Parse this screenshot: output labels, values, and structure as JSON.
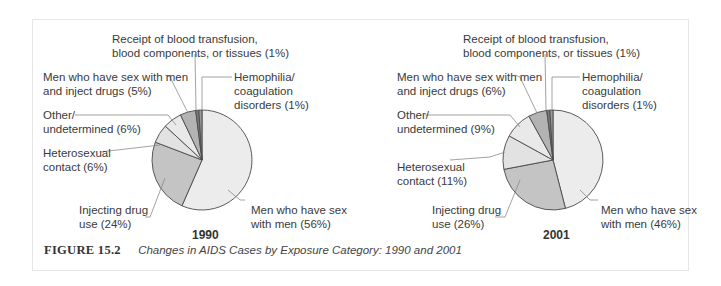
{
  "figure": {
    "number": "FIGURE 15.2",
    "title": "Changes in AIDS Cases by Exposure Category: 1990 and 2001"
  },
  "chart_data": [
    {
      "type": "pie",
      "title": "1990",
      "start_angle": "12 o'clock, clockwise",
      "categories": [
        "Men who have sex with men",
        "Injecting drug use",
        "Heterosexual contact",
        "Other/ undetermined",
        "Men who have sex with men and inject drugs",
        "Receipt of blood transfusion, blood components, or tissues",
        "Hemophilia/ coagulation disorders"
      ],
      "values": [
        56,
        24,
        6,
        6,
        5,
        1,
        1
      ],
      "unit": "%",
      "colors": [
        "#ececec",
        "#c4c4c4",
        "#e2e2e2",
        "#e9e9e9",
        "#b3b3b3",
        "#7a7a7a",
        "#9a9a9a"
      ]
    },
    {
      "type": "pie",
      "title": "2001",
      "start_angle": "12 o'clock, clockwise",
      "categories": [
        "Men who have sex with men",
        "Injecting drug use",
        "Heterosexual contact",
        "Other/ undetermined",
        "Men who have sex with men and inject drugs",
        "Receipt of blood transfusion, blood components, or tissues",
        "Hemophilia/ coagulation disorders"
      ],
      "values": [
        46,
        26,
        11,
        9,
        6,
        1,
        1
      ],
      "unit": "%",
      "colors": [
        "#ececec",
        "#c4c4c4",
        "#e2e2e2",
        "#e9e9e9",
        "#b3b3b3",
        "#7a7a7a",
        "#9a9a9a"
      ]
    }
  ],
  "labels_1990": {
    "transfusion": "Receipt of blood transfusion,\nblood components, or tissues (1%)",
    "msm_idu": "Men who have sex with men\nand inject drugs (5%)",
    "hemophilia": "Hemophilia/\ncoagulation\ndisorders (1%)",
    "other": "Other/\nundetermined (6%)",
    "hetero": "Heterosexual\ncontact (6%)",
    "idu": "Injecting drug\nuse (24%)",
    "msm": "Men who have sex\nwith men (56%)",
    "year": "1990"
  },
  "labels_2001": {
    "transfusion": "Receipt of blood transfusion,\nblood components, or tissues (1%)",
    "msm_idu": "Men who have sex with men\nand inject drugs (6%)",
    "hemophilia": "Hemophilia/\ncoagulation\ndisorders (1%)",
    "other": "Other/\nundetermined (9%)",
    "hetero": "Heterosexual\ncontact (11%)",
    "idu": "Injecting drug\nuse (26%)",
    "msm": "Men who have sex\nwith men (46%)",
    "year": "2001"
  }
}
